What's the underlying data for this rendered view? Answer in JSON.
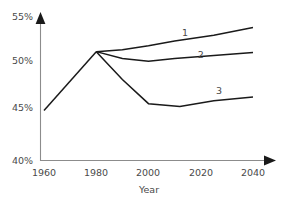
{
  "chart_data": {
    "type": "line",
    "title": "",
    "subtitle": "",
    "xlabel": "Year",
    "ylabel": "",
    "xlim": [
      1960,
      2045
    ],
    "ylim": [
      40,
      55
    ],
    "grid": false,
    "legend_position": "inline-end-of-line",
    "xticks": [
      1960,
      1980,
      2000,
      2020,
      2040
    ],
    "xtick_labels": [
      "1960",
      "1980",
      "2000",
      "2020",
      "2040"
    ],
    "yticks": [
      40,
      45,
      50,
      55
    ],
    "ytick_labels": [
      "40%",
      "45%",
      "50%",
      "55%"
    ],
    "annotations": [
      {
        "text": "1",
        "x": 2014,
        "y": 52.9
      },
      {
        "text": "2",
        "x": 2020,
        "y": 50.6
      },
      {
        "text": "3",
        "x": 2027,
        "y": 46.9
      }
    ],
    "shared_history": {
      "x": [
        1960,
        1980
      ],
      "values": [
        45.2,
        51.3
      ]
    },
    "series": [
      {
        "name": "1",
        "x": [
          1980,
          1990,
          2000,
          2010,
          2025,
          2040
        ],
        "values": [
          51.3,
          51.5,
          51.9,
          52.4,
          53.0,
          53.8
        ]
      },
      {
        "name": "2",
        "x": [
          1980,
          1990,
          2000,
          2010,
          2025,
          2040
        ],
        "values": [
          51.3,
          50.6,
          50.3,
          50.6,
          50.9,
          51.2
        ]
      },
      {
        "name": "3",
        "x": [
          1980,
          1990,
          2000,
          2012,
          2025,
          2040
        ],
        "values": [
          51.3,
          48.4,
          45.9,
          45.6,
          46.2,
          46.6
        ]
      }
    ],
    "colors": {
      "line": "#1a1a1a",
      "axis": "#8c8c8c",
      "text": "#4a4a4a",
      "background": "#ffffff"
    }
  }
}
